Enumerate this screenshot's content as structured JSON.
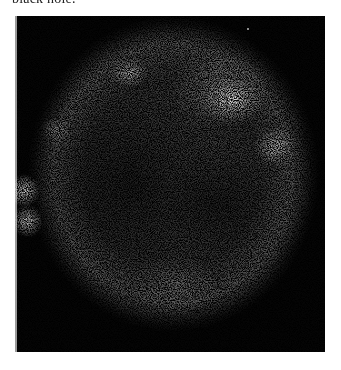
{
  "caption": {
    "fragment": "black hole."
  },
  "figure": {
    "background_color": "#050505",
    "shell_color": "#8c8c8c",
    "highlight_color": "#ffffff"
  }
}
